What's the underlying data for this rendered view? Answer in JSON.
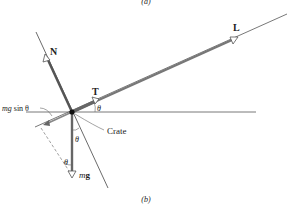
{
  "diagram": {
    "caption_top": "(a)",
    "caption_bottom": "(b)",
    "labels": {
      "L": "L",
      "N": "N",
      "T": "T",
      "mg_m": "m",
      "mg_g": "g",
      "mg_sin_m": "mg",
      "mg_sin_rest": " sin θ",
      "crate": "Crate",
      "theta_T": "θ",
      "theta_mg": "θ",
      "theta_dashed": "θ"
    },
    "colors": {
      "vector": "#6b6b6b",
      "line": "#4a4a4a",
      "dot": "#111111"
    }
  }
}
